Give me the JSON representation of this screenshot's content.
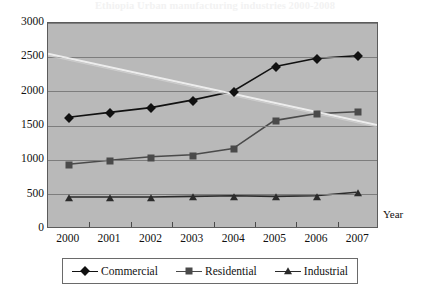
{
  "artifact": {
    "bleed_text": "Ethiopia Urban manufacturing industries 2000-2008"
  },
  "chart_data": {
    "type": "line",
    "title": "",
    "xlabel": "Year",
    "ylabel": "",
    "categories": [
      "2000",
      "2001",
      "2002",
      "2003",
      "2004",
      "2005",
      "2006",
      "2007"
    ],
    "ylim": [
      0,
      3000
    ],
    "ytick_step": 500,
    "yticks": [
      "3000",
      "2500",
      "2000",
      "1500",
      "1000",
      "500",
      "0"
    ],
    "grid": true,
    "legend_position": "bottom",
    "plot_background": "#b9b9b9",
    "series": [
      {
        "name": "Commercial",
        "marker": "diamond",
        "color": "#111111",
        "values": [
          1620,
          1690,
          1760,
          1870,
          2000,
          2360,
          2480,
          2520
        ]
      },
      {
        "name": "Residential",
        "marker": "square",
        "color": "#4a4a4a",
        "values": [
          930,
          990,
          1040,
          1070,
          1160,
          1570,
          1670,
          1700
        ]
      },
      {
        "name": "Industrial",
        "marker": "triangle",
        "color": "#2b2b2b",
        "values": [
          450,
          450,
          450,
          460,
          470,
          460,
          470,
          520
        ]
      }
    ]
  }
}
